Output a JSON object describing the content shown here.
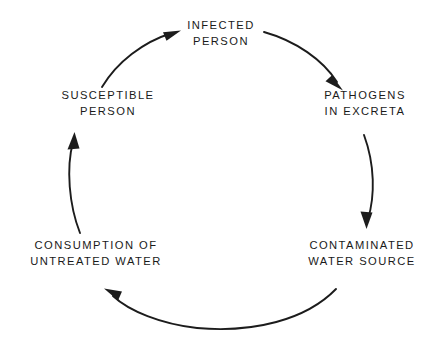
{
  "diagram": {
    "background_color": "#ffffff",
    "ink_color": "#1c1c1c",
    "nodes": [
      {
        "id": "infected-person",
        "lines": [
          "INFECTED",
          "PERSON"
        ],
        "position": "top"
      },
      {
        "id": "pathogens-in-excreta",
        "lines": [
          "PATHOGENS",
          "IN EXCRETA"
        ],
        "position": "upper-right"
      },
      {
        "id": "contaminated-water-source",
        "lines": [
          "CONTAMINATED",
          "WATER SOURCE"
        ],
        "position": "lower-right"
      },
      {
        "id": "consumption-of-untreated-water",
        "lines": [
          "CONSUMPTION OF",
          "UNTREATED WATER"
        ],
        "position": "lower-left"
      },
      {
        "id": "susceptible-person",
        "lines": [
          "SUSCEPTIBLE",
          "PERSON"
        ],
        "position": "upper-left"
      }
    ],
    "arrows": [
      {
        "id": "susceptible-to-infected",
        "from": "susceptible-person",
        "to": "infected-person",
        "direction": "up-right"
      },
      {
        "id": "infected-to-pathogens",
        "from": "infected-person",
        "to": "pathogens-in-excreta",
        "direction": "down-right"
      },
      {
        "id": "pathogens-to-contaminated",
        "from": "pathogens-in-excreta",
        "to": "contaminated-water-source",
        "direction": "down"
      },
      {
        "id": "contaminated-to-consumption",
        "from": "contaminated-water-source",
        "to": "consumption-of-untreated-water",
        "direction": "left"
      },
      {
        "id": "consumption-to-susceptible",
        "from": "consumption-of-untreated-water",
        "to": "susceptible-person",
        "direction": "up"
      }
    ]
  }
}
